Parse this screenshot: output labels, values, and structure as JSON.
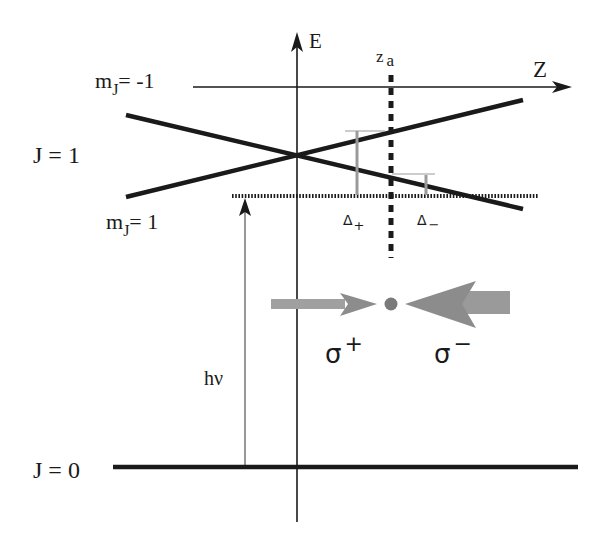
{
  "axes": {
    "energy_label": "E",
    "position_label": "Z",
    "za_label_main": "z",
    "za_label_sub": "a"
  },
  "levels": {
    "upper_label": "J = 1",
    "ground_label": "J = 0",
    "mj_minus_main": "m",
    "mj_minus_sub": "J",
    "mj_minus_value": "= -1",
    "mj_plus_main": "m",
    "mj_plus_sub": "J",
    "mj_plus_value": "= 1"
  },
  "detunings": {
    "delta_plus_main": "Δ",
    "delta_plus_sub": "+",
    "delta_minus_main": "Δ",
    "delta_minus_sub": "−"
  },
  "photon": {
    "label": "hν"
  },
  "beams": {
    "sigma_plus_main": "σ",
    "sigma_plus_sup": "+",
    "sigma_minus_main": "σ",
    "sigma_minus_sup": "−"
  },
  "colors": {
    "line": "#1a1a1a",
    "beam": "#8c8c8c",
    "beam_light": "#a8a8a8",
    "detuning_bar": "#9a9a9a",
    "atom": "#7a7a7a"
  }
}
